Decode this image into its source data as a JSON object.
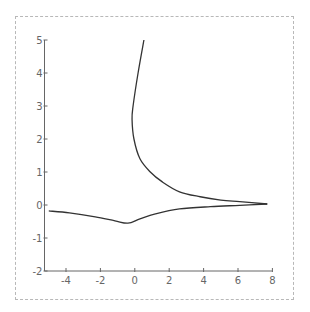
{
  "chart_data": {
    "type": "line",
    "title": "",
    "xlabel": "",
    "ylabel": "",
    "xlim": [
      -5,
      8
    ],
    "ylim": [
      -2,
      5
    ],
    "grid": false,
    "legend": null,
    "x_ticks": [
      -4,
      -2,
      0,
      2,
      4,
      6,
      8
    ],
    "x_tick_labels": [
      "-4",
      "-2",
      "0",
      "2",
      "4",
      "6",
      "8"
    ],
    "y_ticks": [
      -2,
      -1,
      0,
      1,
      2,
      3,
      4,
      5
    ],
    "y_tick_labels": [
      "-2",
      "-1",
      "0",
      "1",
      "2",
      "3",
      "4",
      "5"
    ],
    "series": [
      {
        "name": "upper-branch",
        "color": "#333333",
        "points": [
          [
            0.53,
            5.0
          ],
          [
            0.19,
            4.0
          ],
          [
            -0.1,
            3.0
          ],
          [
            -0.16,
            2.6
          ],
          [
            -0.05,
            2.0
          ],
          [
            0.3,
            1.4
          ],
          [
            0.9,
            1.0
          ],
          [
            1.6,
            0.7
          ],
          [
            2.6,
            0.4
          ],
          [
            3.8,
            0.25
          ],
          [
            5.0,
            0.15
          ],
          [
            6.1,
            0.1
          ],
          [
            7.7,
            0.03
          ]
        ]
      },
      {
        "name": "lower-branch",
        "color": "#333333",
        "points": [
          [
            -5.0,
            -0.18
          ],
          [
            -3.8,
            -0.24
          ],
          [
            -2.3,
            -0.36
          ],
          [
            -1.15,
            -0.48
          ],
          [
            -0.4,
            -0.55
          ],
          [
            0.3,
            -0.42
          ],
          [
            1.2,
            -0.27
          ],
          [
            2.6,
            -0.12
          ],
          [
            4.4,
            -0.05
          ],
          [
            6.1,
            -0.01
          ],
          [
            7.7,
            0.03
          ]
        ]
      }
    ]
  },
  "colors": {
    "axis": "#666666",
    "curve": "#333333",
    "frame": "#b8b8b8"
  }
}
